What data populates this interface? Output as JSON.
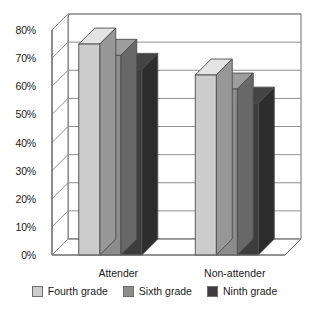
{
  "chart_data": {
    "type": "bar",
    "title": "",
    "subtitle": "",
    "xlabel": "",
    "ylabel": "",
    "categories": [
      "Attender",
      "Non-attender"
    ],
    "series": [
      {
        "name": "Fourth grade",
        "values": [
          75,
          64
        ],
        "color": "#cccccc"
      },
      {
        "name": "Sixth grade",
        "values": [
          71,
          59
        ],
        "color": "#8c8c8c"
      },
      {
        "name": "Ninth grade",
        "values": [
          66,
          54
        ],
        "color": "#3d3d3d"
      }
    ],
    "ylim": [
      0,
      80
    ],
    "ytick_labels": [
      "0%",
      "10%",
      "20%",
      "30%",
      "40%",
      "50%",
      "60%",
      "70%",
      "80%"
    ],
    "ytick_values": [
      0,
      10,
      20,
      30,
      40,
      50,
      60,
      70,
      80
    ],
    "grid": true,
    "grid_axis": "y",
    "legend_position": "bottom",
    "three_d": true,
    "value_suffix": "%"
  },
  "axes": {
    "y_labels": [
      "80%",
      "70%",
      "60%",
      "50%",
      "40%",
      "30%",
      "20%",
      "10%",
      "0%"
    ],
    "x_labels": [
      "Attender",
      "Non-attender"
    ]
  },
  "legend": {
    "entries": [
      {
        "label": "Fourth grade",
        "color": "#cccccc"
      },
      {
        "label": "Sixth grade",
        "color": "#8c8c8c"
      },
      {
        "label": "Ninth grade",
        "color": "#3d3d3d"
      }
    ]
  },
  "colors": {
    "fourth_grade": "#cccccc",
    "sixth_grade": "#8c8c8c",
    "ninth_grade": "#3d3d3d",
    "axis": "#6e6e6e",
    "grid": "#8f8f8f",
    "text": "#1a1a1a",
    "background": "#ffffff"
  }
}
